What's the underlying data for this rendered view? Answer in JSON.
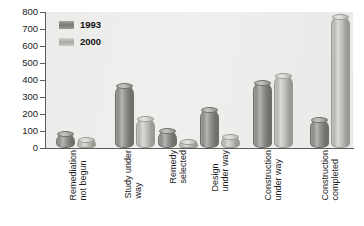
{
  "chart_data": {
    "type": "bar",
    "title": "",
    "subtitle": "",
    "xlabel": "",
    "ylabel": "",
    "ylim": [
      0,
      800
    ],
    "ytick_step": 100,
    "yticks": [
      "800",
      "700",
      "600",
      "500",
      "400",
      "300",
      "200",
      "100",
      "0"
    ],
    "grid": false,
    "legend_position": "top-left",
    "categories": [
      "Remediation not begun",
      "Study under way",
      "Remedy selected",
      "Design under way",
      "Construction under way",
      "Construction completed"
    ],
    "category_lines": [
      [
        "Remediation",
        "not begun"
      ],
      [
        "Study under",
        "way"
      ],
      [
        "Remedy",
        "selected"
      ],
      [
        "Design",
        "under way"
      ],
      [
        "Construction",
        "under way"
      ],
      [
        "Construction",
        "completed"
      ]
    ],
    "series": [
      {
        "name": "1993",
        "color": "#8c8c89",
        "values": [
          75,
          360,
          95,
          215,
          375,
          160
        ]
      },
      {
        "name": "2000",
        "color": "#c3c3bf",
        "values": [
          40,
          165,
          28,
          60,
          415,
          765
        ]
      }
    ]
  },
  "legend": {
    "entries": [
      {
        "label": "1993"
      },
      {
        "label": "2000"
      }
    ]
  }
}
